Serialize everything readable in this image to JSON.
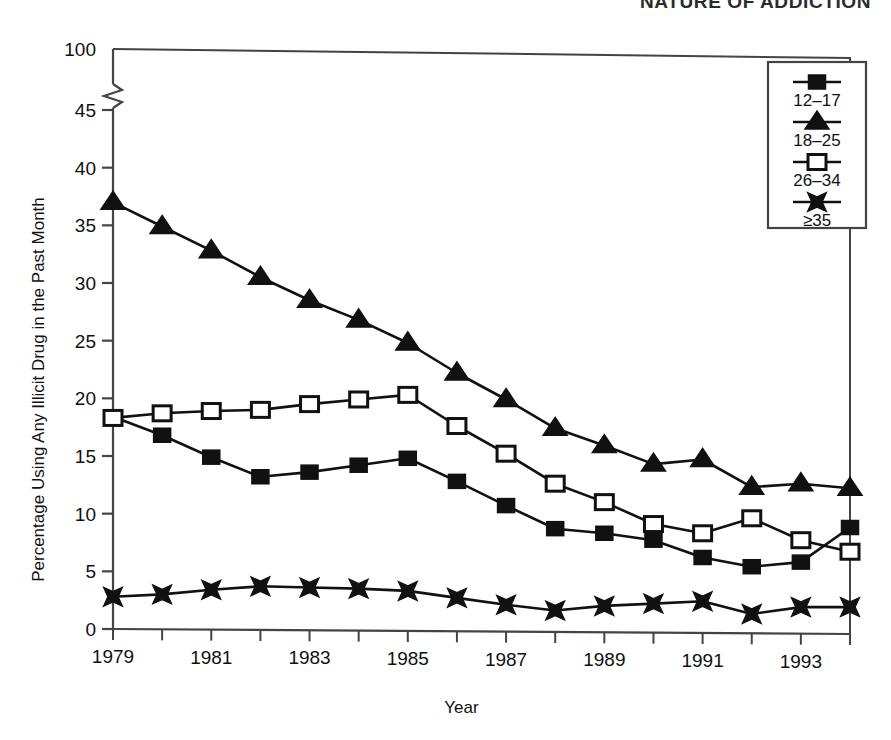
{
  "page": {
    "running_head": "NATURE OF ADDICTION",
    "caption": ""
  },
  "chart_data": {
    "type": "line",
    "title": "",
    "xlabel": "Year",
    "ylabel": "Percentage Using Any Illicit Drug in the Past Month",
    "x": [
      1979,
      1980,
      1981,
      1982,
      1983,
      1984,
      1985,
      1986,
      1987,
      1988,
      1989,
      1990,
      1991,
      1992,
      1993,
      1994
    ],
    "xtick_labels": [
      "1979",
      "1981",
      "1983",
      "1985",
      "1987",
      "1989",
      "1991",
      "1993"
    ],
    "xtick_values": [
      1979,
      1981,
      1983,
      1985,
      1987,
      1989,
      1991,
      1993
    ],
    "xlim": [
      1979,
      1994
    ],
    "ytick_labels": [
      "0",
      "5",
      "10",
      "15",
      "20",
      "25",
      "30",
      "35",
      "40",
      "45",
      "100"
    ],
    "ytick_values": [
      0,
      5,
      10,
      15,
      20,
      25,
      30,
      35,
      40,
      45,
      100
    ],
    "ylim": [
      0,
      45
    ],
    "axis_break": true,
    "axis_break_label": "100",
    "grid": false,
    "legend_position": "top-right",
    "series": [
      {
        "name": "12–17",
        "marker": "filled-square",
        "values": [
          18.4,
          16.8,
          14.9,
          13.2,
          13.6,
          14.2,
          14.8,
          12.8,
          10.7,
          8.7,
          8.3,
          7.7,
          6.2,
          5.4,
          5.8,
          8.8
        ]
      },
      {
        "name": "18–25",
        "marker": "filled-triangle",
        "values": [
          37.0,
          34.9,
          32.8,
          30.5,
          28.5,
          26.8,
          24.8,
          22.2,
          19.9,
          17.4,
          15.9,
          14.3,
          14.7,
          12.3,
          12.6,
          12.2
        ]
      },
      {
        "name": "26–34",
        "marker": "open-square",
        "values": [
          18.3,
          18.7,
          18.9,
          19.0,
          19.5,
          19.9,
          20.3,
          17.6,
          15.2,
          12.6,
          11.0,
          9.1,
          8.3,
          9.6,
          7.7,
          6.7
        ]
      },
      {
        "name": "≥35",
        "marker": "cross-x",
        "values": [
          2.8,
          3.0,
          3.4,
          3.7,
          3.6,
          3.5,
          3.3,
          2.7,
          2.1,
          1.6,
          2.0,
          2.2,
          2.4,
          1.3,
          1.9,
          1.9
        ]
      }
    ]
  },
  "colors": {
    "line": "#111111",
    "marker_fill": "#111111",
    "marker_open_fill": "#ffffff",
    "axis": "#444444",
    "text": "#111111"
  }
}
